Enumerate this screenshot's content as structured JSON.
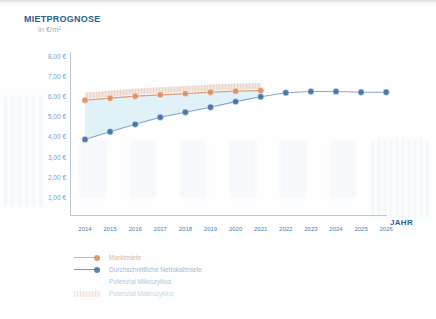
{
  "header": {
    "title": "MIETPROGNOSE",
    "subtitle": "in €/m²"
  },
  "axis": {
    "x_title": "JAHR"
  },
  "legend": {
    "items": [
      {
        "label": "Marktmiete",
        "key": "line-marker",
        "color": "#d98c5f"
      },
      {
        "label": "Durchschnittliche Nettokaltmiete",
        "key": "line-marker",
        "color": "#3f6fa8"
      },
      {
        "label": "Potenzial Mikrozyklus",
        "key": "area-swatch",
        "color": "#d6ecf5"
      },
      {
        "label": "Potenzial Makrozyklus",
        "key": "hatch-swatch",
        "color": "#e8d6cc"
      }
    ]
  },
  "chart_data": {
    "type": "line",
    "title": "MIETPROGNOSE",
    "subtitle": "in €/m²",
    "xlabel": "JAHR",
    "ylabel": "in €/m²",
    "categories": [
      "2014",
      "2015",
      "2016",
      "2017",
      "2018",
      "2019",
      "2020",
      "2021",
      "2022",
      "2023",
      "2024",
      "2025",
      "2026"
    ],
    "x": [
      2014,
      2015,
      2016,
      2017,
      2018,
      2019,
      2020,
      2021,
      2022,
      2023,
      2024,
      2025,
      2026
    ],
    "ylim": [
      0,
      8
    ],
    "ytick_labels": [
      "8,00 €",
      "7,00 €",
      "6,00 €",
      "5,00 €",
      "4,00 €",
      "3,00 €",
      "2,00 €",
      "1,00 €"
    ],
    "ytick_values": [
      8,
      7,
      6,
      5,
      4,
      3,
      2,
      1
    ],
    "grid": false,
    "legend_position": "bottom-left",
    "currency": "EUR",
    "unit": "€/m²",
    "series": [
      {
        "name": "Marktmiete",
        "color": "#d98c5f",
        "values": [
          5.85,
          5.95,
          6.05,
          6.12,
          6.18,
          6.25,
          6.3,
          6.33,
          null,
          null,
          null,
          null,
          null
        ]
      },
      {
        "name": "Durchschnittliche Nettokaltmiete",
        "color": "#3f6fa8",
        "values": [
          3.9,
          4.28,
          4.65,
          5.0,
          5.25,
          5.5,
          5.78,
          6.02,
          6.22,
          6.28,
          6.28,
          6.25,
          6.25
        ]
      }
    ],
    "bands": [
      {
        "name": "Potenzial Mikrozyklus",
        "description": "Fläche zwischen Nettokaltmiete und Marktmiete",
        "color": "#d6ecf5",
        "from_series": "Durchschnittliche Nettokaltmiete",
        "to_series": "Marktmiete"
      },
      {
        "name": "Potenzial Makrozyklus",
        "description": "Schraffiertes Band oberhalb der Marktmiete",
        "color": "#e8d6cc",
        "hatched": true,
        "height_eur": 0.38
      }
    ]
  }
}
